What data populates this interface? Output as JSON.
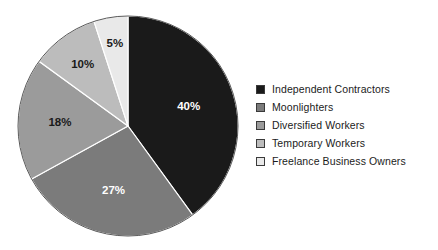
{
  "chart_data": {
    "type": "pie",
    "title": "",
    "subtitle": "",
    "xlabel": "",
    "ylabel": "",
    "grid": false,
    "legend_position": "right",
    "start_angle_deg": 0,
    "direction": "clockwise",
    "categories": [
      "Independent Contractors",
      "Moonlighters",
      "Diversified Workers",
      "Temporary Workers",
      "Freelance Business Owners"
    ],
    "values": [
      40,
      27,
      18,
      10,
      5
    ],
    "value_labels": [
      "40%",
      "27%",
      "18%",
      "10%",
      "5%"
    ],
    "colors": [
      "#1a1a1a",
      "#7b7b7b",
      "#9b9b9b",
      "#bcbcbc",
      "#e9e9e9"
    ],
    "label_colors": [
      "#ffffff",
      "#ffffff",
      "#1a1a1a",
      "#1a1a1a",
      "#1a1a1a"
    ],
    "units": "percent",
    "total": 100
  },
  "pie": {
    "slices": [
      {
        "label": "Independent Contractors",
        "value": 40,
        "value_label": "40%",
        "color": "#1a1a1a",
        "label_color": "#ffffff"
      },
      {
        "label": "Moonlighters",
        "value": 27,
        "value_label": "27%",
        "color": "#7b7b7b",
        "label_color": "#ffffff"
      },
      {
        "label": "Diversified Workers",
        "value": 18,
        "value_label": "18%",
        "color": "#9b9b9b",
        "label_color": "#1a1a1a"
      },
      {
        "label": "Temporary Workers",
        "value": 10,
        "value_label": "10%",
        "color": "#bcbcbc",
        "label_color": "#1a1a1a"
      },
      {
        "label": "Freelance Business Owners",
        "value": 5,
        "value_label": "5%",
        "color": "#e9e9e9",
        "label_color": "#1a1a1a"
      }
    ]
  },
  "legend": {
    "items": [
      {
        "label": "Independent Contractors",
        "color": "#1a1a1a"
      },
      {
        "label": "Moonlighters",
        "color": "#7b7b7b"
      },
      {
        "label": "Diversified Workers",
        "color": "#9b9b9b"
      },
      {
        "label": "Temporary Workers",
        "color": "#bcbcbc"
      },
      {
        "label": "Freelance Business Owners",
        "color": "#e9e9e9"
      }
    ]
  }
}
